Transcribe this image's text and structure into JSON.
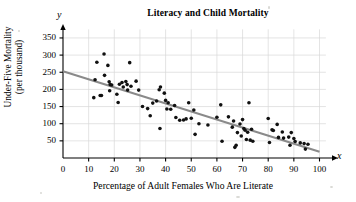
{
  "chart_data": {
    "type": "scatter",
    "title": "Literacy and Child Mortality",
    "xlabel": "Percentage of Adult Females Who Are Literate",
    "ylabel": "Under-Five Mortality\n(per thousand)",
    "x_axis_symbol": "x",
    "y_axis_symbol": "y",
    "xlim": [
      0,
      107
    ],
    "ylim": [
      0,
      375
    ],
    "xticks": [
      0,
      10,
      20,
      30,
      40,
      50,
      60,
      70,
      80,
      90,
      100
    ],
    "ytick_values": [
      50,
      100,
      150,
      200,
      250,
      300,
      350
    ],
    "ytick_labels": [
      "50",
      "100",
      "150",
      "200",
      "250",
      "300",
      "350"
    ],
    "xtick_labels": [
      "0",
      "10",
      "20",
      "30",
      "40",
      "50",
      "60",
      "70",
      "80",
      "90",
      "100"
    ],
    "grid": true,
    "grid_color": "#d9d9d9",
    "legend": null,
    "marker_color": "#111111",
    "marker_size": 3.6,
    "trendline": {
      "label": "least-squares regression line",
      "color": "#8a8a8a",
      "width": 2.0,
      "x_start": 0,
      "y_start": 253,
      "x_end": 100,
      "y_end": 18
    },
    "points": [
      [
        12.5,
        228
      ],
      [
        12.0,
        176
      ],
      [
        13.2,
        279
      ],
      [
        14.5,
        182
      ],
      [
        15.0,
        182
      ],
      [
        16.0,
        303
      ],
      [
        16.2,
        241
      ],
      [
        17.5,
        270
      ],
      [
        18.0,
        222
      ],
      [
        18.4,
        214
      ],
      [
        18.2,
        196
      ],
      [
        19.0,
        213
      ],
      [
        21.0,
        186
      ],
      [
        21.5,
        162
      ],
      [
        22.0,
        215
      ],
      [
        23.0,
        220
      ],
      [
        23.5,
        207
      ],
      [
        24.5,
        223
      ],
      [
        25.2,
        198
      ],
      [
        25.0,
        214
      ],
      [
        26.0,
        278
      ],
      [
        26.5,
        209
      ],
      [
        28.5,
        224
      ],
      [
        29.5,
        198
      ],
      [
        31.0,
        150
      ],
      [
        33.0,
        144
      ],
      [
        34.0,
        123
      ],
      [
        35.0,
        160
      ],
      [
        36.5,
        166
      ],
      [
        37.5,
        199
      ],
      [
        38.0,
        207
      ],
      [
        37.8,
        86
      ],
      [
        39.5,
        189
      ],
      [
        40.0,
        168
      ],
      [
        40.5,
        143
      ],
      [
        41.0,
        161
      ],
      [
        42.0,
        142
      ],
      [
        43.5,
        153
      ],
      [
        44.0,
        118
      ],
      [
        45.5,
        110
      ],
      [
        47.0,
        111
      ],
      [
        48.0,
        114
      ],
      [
        49.0,
        161
      ],
      [
        50.0,
        116
      ],
      [
        51.0,
        140
      ],
      [
        51.5,
        69
      ],
      [
        53.0,
        100
      ],
      [
        56.5,
        96
      ],
      [
        60.0,
        119
      ],
      [
        61.5,
        155
      ],
      [
        62.0,
        49
      ],
      [
        64.5,
        120
      ],
      [
        66.0,
        90
      ],
      [
        66.5,
        108
      ],
      [
        67.0,
        31
      ],
      [
        67.5,
        37
      ],
      [
        68.0,
        74
      ],
      [
        69.0,
        99
      ],
      [
        69.5,
        64
      ],
      [
        70.0,
        112
      ],
      [
        70.5,
        86
      ],
      [
        71.0,
        81
      ],
      [
        71.5,
        54
      ],
      [
        72.0,
        75
      ],
      [
        72.5,
        161
      ],
      [
        73.0,
        52
      ],
      [
        73.5,
        84
      ],
      [
        74.0,
        49
      ],
      [
        80.0,
        115
      ],
      [
        80.5,
        45
      ],
      [
        81.5,
        82
      ],
      [
        82.0,
        80
      ],
      [
        83.5,
        98
      ],
      [
        84.0,
        60
      ],
      [
        85.5,
        76
      ],
      [
        86.0,
        58
      ],
      [
        88.0,
        61
      ],
      [
        88.5,
        37
      ],
      [
        89.0,
        74
      ],
      [
        90.0,
        57
      ],
      [
        90.5,
        48
      ],
      [
        92.5,
        44
      ],
      [
        94.0,
        42
      ],
      [
        94.5,
        26
      ],
      [
        95.5,
        40
      ]
    ]
  }
}
